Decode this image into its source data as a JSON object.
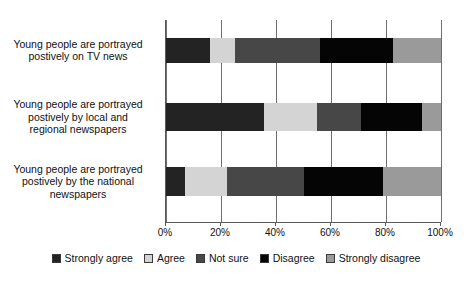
{
  "chart_data": {
    "type": "bar",
    "orientation": "horizontal",
    "stacked": true,
    "stack_mode": "percent",
    "title": "",
    "subtitle": "",
    "xlabel": "",
    "ylabel": "",
    "xlim": [
      0,
      100
    ],
    "xticks": [
      0,
      20,
      40,
      60,
      80,
      100
    ],
    "xticklabels": [
      "0%",
      "20%",
      "40%",
      "60%",
      "80%",
      "100%"
    ],
    "grid": true,
    "grid_axis": "x",
    "legend_position": "bottom",
    "categories": [
      "Young people are portrayed postively on TV news",
      "Young people are portrayed postively by local and regional newspapers",
      "Young people are portrayed postively by the national newspapers"
    ],
    "category_lines": [
      [
        "Young people are portrayed",
        "postively on TV news"
      ],
      [
        "Young people are portrayed",
        "postively by local and",
        "regional newspapers"
      ],
      [
        "Young people are portrayed",
        "postively by the national",
        "newspapers"
      ]
    ],
    "series": [
      {
        "name": "Strongly agree",
        "color": "#232323",
        "values": [
          16.0,
          35.5,
          7.0
        ]
      },
      {
        "name": "Agree",
        "color": "#d4d4d4",
        "values": [
          9.0,
          19.5,
          15.0
        ]
      },
      {
        "name": "Not sure",
        "color": "#474747",
        "values": [
          31.0,
          16.0,
          28.0
        ]
      },
      {
        "name": "Disagree",
        "color": "#050505",
        "values": [
          26.5,
          22.0,
          29.0
        ]
      },
      {
        "name": "Strongly disagree",
        "color": "#9a9a9a",
        "values": [
          17.5,
          7.0,
          21.0
        ]
      }
    ]
  },
  "legend": {
    "items": [
      {
        "label": "Strongly agree",
        "color": "#232323"
      },
      {
        "label": "Agree",
        "color": "#d4d4d4"
      },
      {
        "label": "Not sure",
        "color": "#474747"
      },
      {
        "label": "Disagree",
        "color": "#050505"
      },
      {
        "label": "Strongly disagree",
        "color": "#9a9a9a"
      }
    ]
  }
}
